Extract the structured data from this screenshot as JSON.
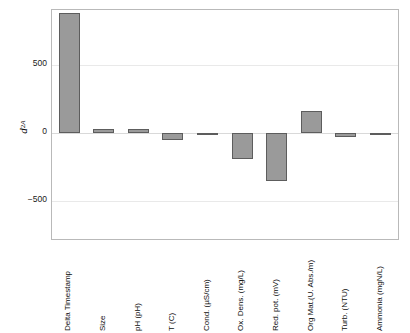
{
  "chart_data": {
    "type": "bar",
    "title": "",
    "xlabel": "",
    "ylabel": "d²A",
    "ylabel_parts": {
      "base": "d",
      "sup": "2",
      "sub": "A"
    },
    "categories": [
      "Delta Timestamp",
      "Size",
      "pH (pH)",
      "T (C)",
      "Cond. (µS/cm)",
      "Ox. Dens. (mg/L)",
      "Red. pot. (mV)",
      "Org Mat.(U. Abs./m)",
      "Turb. (NTU)",
      "Ammonia (mgN/L)"
    ],
    "values": [
      880,
      30,
      28,
      -55,
      -8,
      -190,
      -350,
      160,
      -30,
      -10
    ],
    "yticks": [
      500,
      0,
      -500
    ],
    "ytick_labels": [
      "500",
      "0",
      "−500"
    ],
    "ylim": [
      -780,
      905
    ],
    "grid": true,
    "legend": "none",
    "bar_color": "#9a9a9a",
    "bar_edge_color": "#5d5d5d",
    "axes_color": "#b9b9b9",
    "grid_color": "#e9e9e9",
    "background": "#ffffff"
  }
}
